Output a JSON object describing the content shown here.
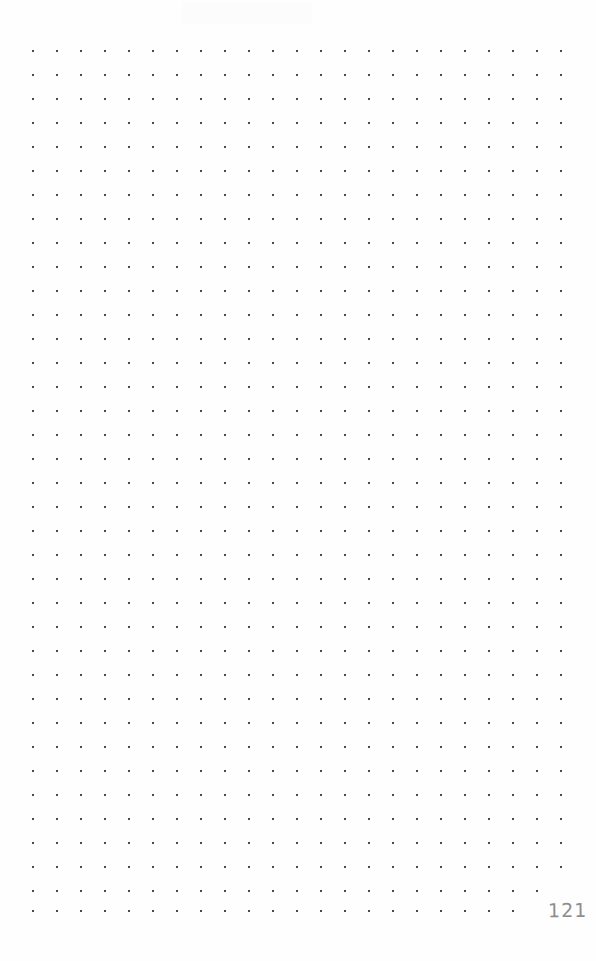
{
  "page": {
    "width": 596,
    "height": 961,
    "background_color": "#fefefe",
    "kind": "dot-grid-notebook-page",
    "content_text": ""
  },
  "grid": {
    "dot_color": "#4a4a52",
    "dot_size_px": 2,
    "spacing_px": 24,
    "origin_x": 33,
    "origin_y": 51,
    "columns": 23,
    "rows": 37,
    "column_positions": [
      33,
      57,
      81,
      105,
      129,
      153,
      177,
      201,
      225,
      249,
      273,
      297,
      321,
      345,
      369,
      393,
      417,
      441,
      465,
      489,
      513,
      537,
      561
    ],
    "row_positions": [
      51,
      75,
      99,
      123,
      147,
      171,
      195,
      219,
      243,
      267,
      291,
      315,
      339,
      363,
      387,
      411,
      435,
      459,
      483,
      507,
      531,
      555,
      579,
      603,
      627,
      651,
      675,
      699,
      723,
      747,
      771,
      795,
      819,
      843,
      867,
      891,
      911
    ],
    "hidden_dots": [
      {
        "col": 21,
        "row": 36
      },
      {
        "col": 22,
        "row": 36
      },
      {
        "col": 22,
        "row": 35
      }
    ]
  },
  "page_number": {
    "label": "121",
    "color": "#8e8e92",
    "x": 548,
    "y": 896
  },
  "artifact": {
    "label": "scan-artifact",
    "color": "#fcfcfc"
  }
}
